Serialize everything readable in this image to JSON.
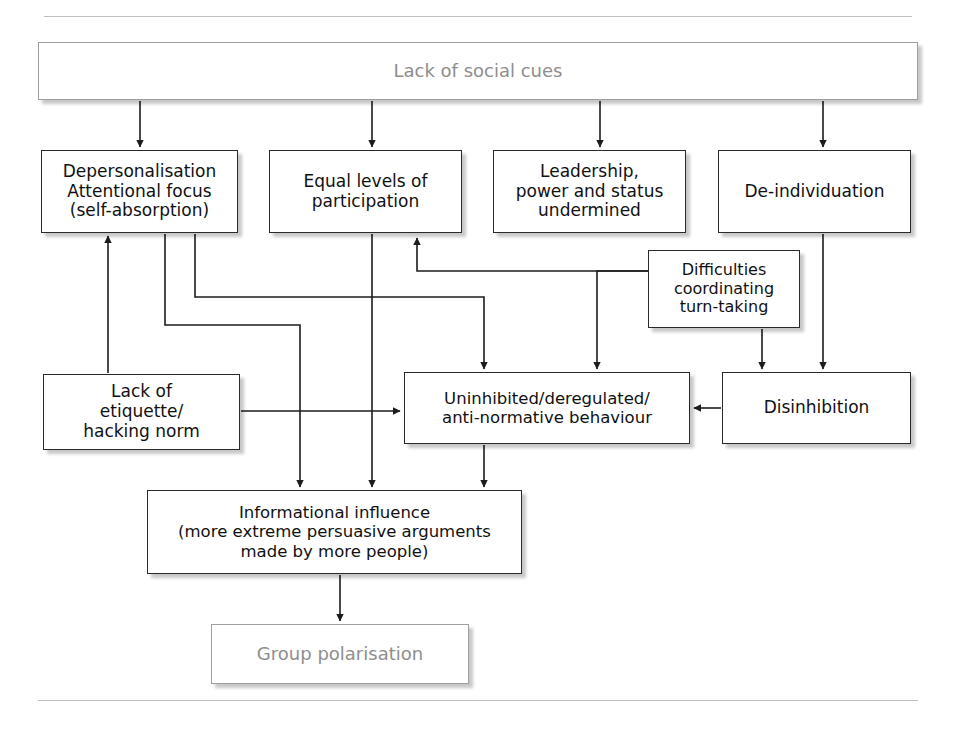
{
  "diagram": {
    "top_rule": true,
    "bottom_rule": true,
    "nodes": [
      {
        "id": "lack-of-social-cues",
        "label": "Lack of social cues",
        "style": "muted",
        "x": 38,
        "y": 42,
        "w": 880,
        "h": 58
      },
      {
        "id": "depersonalisation",
        "label": "Depersonalisation\nAttentional focus\n(self-absorption)",
        "style": "normal",
        "x": 41,
        "y": 150,
        "w": 197,
        "h": 83
      },
      {
        "id": "equal-levels-of-participation",
        "label": "Equal levels of\nparticipation",
        "style": "normal",
        "x": 269,
        "y": 150,
        "w": 193,
        "h": 83
      },
      {
        "id": "leadership-power-status-undermined",
        "label": "Leadership,\npower and status\nundermined",
        "style": "normal",
        "x": 493,
        "y": 150,
        "w": 193,
        "h": 83
      },
      {
        "id": "de-individuation",
        "label": "De-individuation",
        "style": "normal",
        "x": 718,
        "y": 150,
        "w": 193,
        "h": 83
      },
      {
        "id": "difficulties-coordinating-turn-taking",
        "label": "Difficulties\ncoordinating\nturn-taking",
        "style": "normal",
        "x": 648,
        "y": 250,
        "w": 152,
        "h": 78
      },
      {
        "id": "lack-of-etiquette-hacking-norm",
        "label": "Lack of\netiquette/\nhacking norm",
        "style": "normal",
        "x": 43,
        "y": 374,
        "w": 197,
        "h": 76
      },
      {
        "id": "uninhibited-deregulated-anti-normative-behaviour",
        "label": "Uninhibited/deregulated/\nanti-normative behaviour",
        "style": "normal",
        "x": 404,
        "y": 372,
        "w": 286,
        "h": 72
      },
      {
        "id": "disinhibition",
        "label": "Disinhibition",
        "style": "normal",
        "x": 722,
        "y": 372,
        "w": 189,
        "h": 72
      },
      {
        "id": "informational-influence",
        "label": "Informational influence\n(more extreme persuasive arguments\nmade by more people)",
        "style": "normal",
        "x": 147,
        "y": 490,
        "w": 375,
        "h": 84
      },
      {
        "id": "group-polarisation",
        "label": "Group polarisation",
        "style": "muted",
        "x": 211,
        "y": 624,
        "w": 258,
        "h": 60
      }
    ],
    "edges": [
      {
        "id": "edge-cues-to-depersonalisation",
        "from": "lack-of-social-cues",
        "to": "depersonalisation"
      },
      {
        "id": "edge-cues-to-equal-levels",
        "from": "lack-of-social-cues",
        "to": "equal-levels-of-participation"
      },
      {
        "id": "edge-cues-to-leadership",
        "from": "lack-of-social-cues",
        "to": "leadership-power-status-undermined"
      },
      {
        "id": "edge-cues-to-de-individuation",
        "from": "lack-of-social-cues",
        "to": "de-individuation"
      },
      {
        "id": "edge-difficulties-to-leadership",
        "from": "difficulties-coordinating-turn-taking",
        "to": "leadership-power-status-undermined"
      },
      {
        "id": "edge-difficulties-to-disinhibition",
        "from": "difficulties-coordinating-turn-taking",
        "to": "disinhibition"
      },
      {
        "id": "edge-de-individuation-to-disinhibition",
        "from": "de-individuation",
        "to": "disinhibition"
      },
      {
        "id": "edge-de-individuation-to-uninhibited",
        "from": "de-individuation",
        "to": "uninhibited-deregulated-anti-normative-behaviour"
      },
      {
        "id": "edge-etiquette-to-depersonalisation",
        "from": "lack-of-etiquette-hacking-norm",
        "to": "depersonalisation"
      },
      {
        "id": "edge-etiquette-to-uninhibited",
        "from": "lack-of-etiquette-hacking-norm",
        "to": "uninhibited-deregulated-anti-normative-behaviour"
      },
      {
        "id": "edge-disinhibition-to-uninhibited",
        "from": "disinhibition",
        "to": "uninhibited-deregulated-anti-normative-behaviour"
      },
      {
        "id": "edge-depersonalisation-to-uninhibited",
        "from": "depersonalisation",
        "to": "uninhibited-deregulated-anti-normative-behaviour"
      },
      {
        "id": "edge-depersonalisation-to-informational",
        "from": "depersonalisation",
        "to": "informational-influence"
      },
      {
        "id": "edge-equal-levels-to-informational",
        "from": "equal-levels-of-participation",
        "to": "informational-influence"
      },
      {
        "id": "edge-uninhibited-to-informational",
        "from": "uninhibited-deregulated-anti-normative-behaviour",
        "to": "informational-influence"
      },
      {
        "id": "edge-informational-to-group-polarisation",
        "from": "informational-influence",
        "to": "group-polarisation"
      }
    ],
    "colors": {
      "box_border": "#2a2a2a",
      "muted_text": "#8e8e8e",
      "line": "#1c1c1c",
      "rule": "#bdbdbd",
      "background": "#ffffff"
    }
  }
}
